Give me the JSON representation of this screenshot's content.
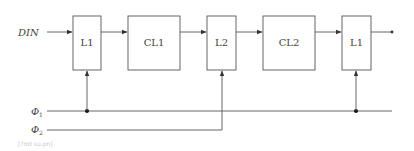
{
  "diagram": {
    "input_label": "DIN",
    "blocks": [
      {
        "id": "latch-1a",
        "label": "L1"
      },
      {
        "id": "comb-1",
        "label": "CL1"
      },
      {
        "id": "latch-2",
        "label": "L2"
      },
      {
        "id": "comb-2",
        "label": "CL2"
      },
      {
        "id": "latch-1b",
        "label": "L1"
      }
    ],
    "clocks": [
      {
        "symbol": "Φ",
        "subscript": "1"
      },
      {
        "symbol": "Φ",
        "subscript": "2"
      }
    ],
    "caption": "[?rot su.pn]",
    "colors": {
      "line": "#555555",
      "text": "#444444",
      "caption": "#c8c8c8"
    }
  }
}
